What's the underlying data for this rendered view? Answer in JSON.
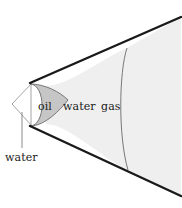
{
  "figure": {
    "type": "cross-section-diagram",
    "title": "",
    "background_color": "#ffffff",
    "width": 182,
    "height": 208
  },
  "colors": {
    "oil_fill": "#c6c6c6",
    "water_fill": "#efefef",
    "gas_fill": "#ffffff",
    "outer_wedge_fill": "#ffffff",
    "thick_boundary_stroke": "#1a1a1a",
    "thin_curve_stroke": "#555555",
    "thin_wedge_stroke": "#9a9a9a",
    "leader_line_stroke": "#8c8c8c",
    "label_text": "#1a1a1a"
  },
  "labels": {
    "oil": "oil",
    "water": "water",
    "gas": "gas",
    "water_callout": "water"
  },
  "regions": [
    {
      "name": "water-invasion-wedge",
      "label": "water",
      "fill": "#ffffff",
      "order": 0
    },
    {
      "name": "oil-bank",
      "label": "oil",
      "fill": "#c6c6c6",
      "order": 1
    },
    {
      "name": "water-bank",
      "label": "water",
      "fill": "#efefef",
      "order": 2
    },
    {
      "name": "gas-cap",
      "label": "gas",
      "fill": "#ffffff",
      "order": 3
    }
  ],
  "geometry": {
    "apex": [
      12,
      104
    ],
    "upper_boundary_end": [
      181,
      17
    ],
    "lower_boundary_end": [
      181,
      196
    ],
    "gas_curve_max_x": 122,
    "leader_line": {
      "x": 22,
      "y_top": 112,
      "y_bottom": 148
    }
  }
}
